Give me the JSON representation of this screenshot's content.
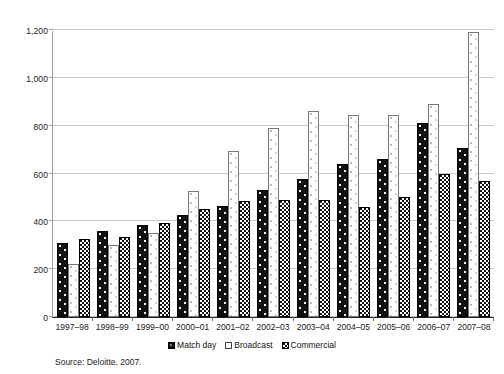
{
  "chart_data": {
    "type": "bar",
    "title": "",
    "subtitle": "",
    "xlabel": "",
    "ylabel": "",
    "ylim": [
      0,
      1200
    ],
    "yticks": [
      0,
      200,
      400,
      600,
      800,
      1000,
      1200
    ],
    "ytick_labels": [
      "0",
      "200",
      "400",
      "600",
      "800",
      "1,000",
      "1,200"
    ],
    "grid": true,
    "legend_position": "bottom-center",
    "categories": [
      "1997–98",
      "1998–99",
      "1999–00",
      "2000–01",
      "2001–02",
      "2002–03",
      "2003–04",
      "2004–05",
      "2005–06",
      "2006–07",
      "2007–08"
    ],
    "series": [
      {
        "name": "Match day",
        "values": [
          310,
          360,
          385,
          425,
          465,
          530,
          575,
          640,
          660,
          810,
          705
        ]
      },
      {
        "name": "Broadcast",
        "values": [
          220,
          300,
          350,
          525,
          695,
          790,
          860,
          845,
          845,
          890,
          1190
        ]
      },
      {
        "name": "Commercial",
        "values": [
          325,
          335,
          395,
          450,
          485,
          490,
          490,
          460,
          500,
          600,
          570
        ]
      }
    ],
    "annotations": []
  },
  "legend": {
    "items": [
      {
        "label": "Match day",
        "swatch": "series-0-swatch"
      },
      {
        "label": "Broadcast",
        "swatch": "series-1-swatch"
      },
      {
        "label": "Commercial",
        "swatch": "series-2-swatch"
      }
    ]
  },
  "source": {
    "text": "Source: Deloitte, 2007."
  },
  "colors": {
    "series_match_day": "#111111",
    "series_broadcast": "#ffffff",
    "series_commercial": "#151515",
    "gridline": "#c9c9c9",
    "axis": "#222222",
    "text": "#1a1a1a"
  }
}
